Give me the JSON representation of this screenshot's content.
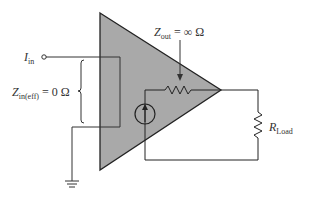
{
  "diagram": {
    "colors": {
      "amplifier_fill": "#a9a9a9",
      "amplifier_stroke": "#222222",
      "wire": "#333333",
      "text": "#333333",
      "background": "#ffffff"
    },
    "labels": {
      "input_current": {
        "symbol": "I",
        "subscript": "in"
      },
      "input_impedance": {
        "symbol": "Z",
        "subscript": "in(eff)",
        "equals": "= 0 Ω"
      },
      "output_impedance": {
        "symbol": "Z",
        "subscript": "out",
        "equals": "= ∞ Ω"
      },
      "load_resistor": {
        "symbol": "R",
        "subscript": "Load"
      }
    },
    "components": [
      {
        "id": "amplifier",
        "type": "triangle"
      },
      {
        "id": "input-terminal",
        "type": "terminal-circle"
      },
      {
        "id": "current-source",
        "type": "dependent-current-source",
        "direction": "up"
      },
      {
        "id": "output-resistor",
        "type": "resistor"
      },
      {
        "id": "load-resistor",
        "type": "resistor"
      },
      {
        "id": "ground",
        "type": "ground"
      },
      {
        "id": "input-brace",
        "type": "brace"
      },
      {
        "id": "zout-arrow",
        "type": "arrow"
      }
    ]
  }
}
